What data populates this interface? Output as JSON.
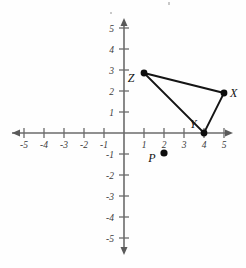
{
  "chart_data": {
    "type": "scatter",
    "title": "",
    "xlabel": "",
    "ylabel": "",
    "xlim": [
      -5.6,
      5.6
    ],
    "ylim": [
      -5.6,
      5.6
    ],
    "grid": false,
    "legend": null,
    "x_ticks": [
      -5,
      -4,
      -3,
      -2,
      -1,
      1,
      2,
      3,
      4,
      5
    ],
    "y_ticks": [
      -5,
      -4,
      -3,
      -2,
      -1,
      1,
      2,
      3,
      4,
      5
    ],
    "x_tick_labels": [
      "-5",
      "-4",
      "-3",
      "-2",
      "-1",
      "1",
      "2",
      "3",
      "4",
      "5"
    ],
    "y_tick_labels": [
      "-5",
      "-4",
      "-3",
      "-2",
      "-1",
      "1",
      "2",
      "3",
      "4",
      "5"
    ],
    "points": [
      {
        "label": "Z",
        "x": 1,
        "y": 3,
        "label_dx": -13,
        "label_dy": 9
      },
      {
        "label": "X",
        "x": 5,
        "y": 2,
        "label_dx": 6,
        "label_dy": 4
      },
      {
        "label": "Y",
        "x": 4,
        "y": 0,
        "label_dx": -11,
        "label_dy": -5
      },
      {
        "label": "P",
        "x": 2,
        "y": -1,
        "label_dx": -12,
        "label_dy": 9
      }
    ],
    "polygon": {
      "name": "triangle-XYZ",
      "vertices": [
        "Z",
        "X",
        "Y"
      ],
      "closed": true
    }
  },
  "axes": {
    "x_axis_name": "x-axis",
    "y_axis_name": "y-axis",
    "origin_label": ""
  },
  "colors": {
    "axis": "#6b6b6b",
    "edge": "#141414",
    "dot": "#0d0d0d",
    "label": "#111111",
    "background": "#fefefe"
  }
}
